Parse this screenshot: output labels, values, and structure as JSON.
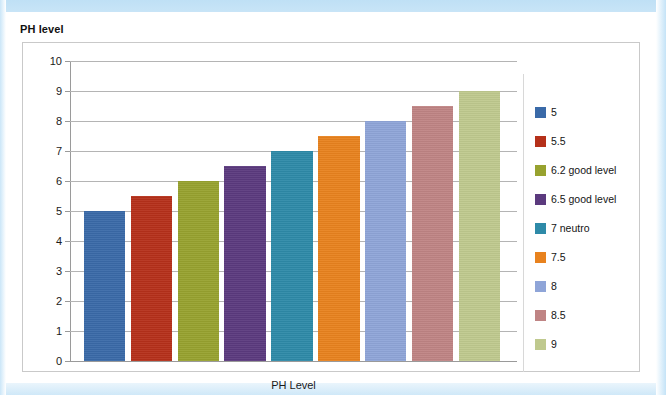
{
  "chart_title": "PH level",
  "axis": {
    "x_title": "PH Level",
    "y_ticks": [
      "10",
      "9",
      "8",
      "7",
      "6",
      "5",
      "4",
      "3",
      "2",
      "1",
      "0"
    ]
  },
  "legend": {
    "items": [
      {
        "label": "5",
        "color": "#3a6aa8"
      },
      {
        "label": "5.5",
        "color": "#b5301a"
      },
      {
        "label": "6.2 good level",
        "color": "#97a22f"
      },
      {
        "label": "6.5 good level",
        "color": "#5b3a7e"
      },
      {
        "label": "7 neutro",
        "color": "#2e8aa8"
      },
      {
        "label": "7.5",
        "color": "#e8821e"
      },
      {
        "label": "8",
        "color": "#8fa5d8"
      },
      {
        "label": "8.5",
        "color": "#bf8484"
      },
      {
        "label": "9",
        "color": "#bfc98e"
      }
    ]
  },
  "chart_data": {
    "type": "bar",
    "title": "PH level",
    "xlabel": "PH Level",
    "ylabel": "",
    "ylim": [
      0,
      10
    ],
    "ytick_step": 1,
    "grid": true,
    "legend_position": "right",
    "categories": [
      "5",
      "5.5",
      "6.2 good level",
      "6.5 good level",
      "7 neutro",
      "7.5",
      "8",
      "8.5",
      "9"
    ],
    "values": [
      5,
      5.5,
      6,
      6.5,
      7,
      7.5,
      8,
      8.5,
      9
    ],
    "colors": [
      "#3a6aa8",
      "#b5301a",
      "#97a22f",
      "#5b3a7e",
      "#2e8aa8",
      "#e8821e",
      "#8fa5d8",
      "#bf8484",
      "#bfc98e"
    ],
    "series": [
      {
        "name": "PH level",
        "values": [
          5,
          5.5,
          6,
          6.5,
          7,
          7.5,
          8,
          8.5,
          9
        ]
      }
    ]
  }
}
